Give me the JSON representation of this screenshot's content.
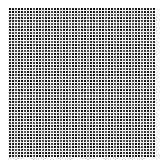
{
  "pattern": {
    "type": "grid-pattern",
    "cell_color": "#1a1a1a",
    "line_color": "#f4f4f4",
    "background_color": "#ffffff",
    "cell_period_px": 3,
    "approx_columns": 48,
    "approx_rows": 49
  }
}
